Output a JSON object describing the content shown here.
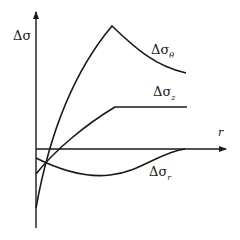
{
  "diagram": {
    "type": "schematic stress-change curves",
    "y_axis_label": "Δσ",
    "x_axis_label": "r",
    "curves": [
      {
        "name": "theta",
        "label_main": "Δσ",
        "label_sub": "θ",
        "shape": "rises steeply from below r-axis to a peak, then decays"
      },
      {
        "name": "z",
        "label_main": "Δσ",
        "label_sub": "z",
        "shape": "rises linearly to a kink, then constant"
      },
      {
        "name": "r",
        "label_main": "Δσ",
        "label_sub": "r",
        "shape": "starts slightly negative, dips, then returns to zero"
      }
    ]
  }
}
